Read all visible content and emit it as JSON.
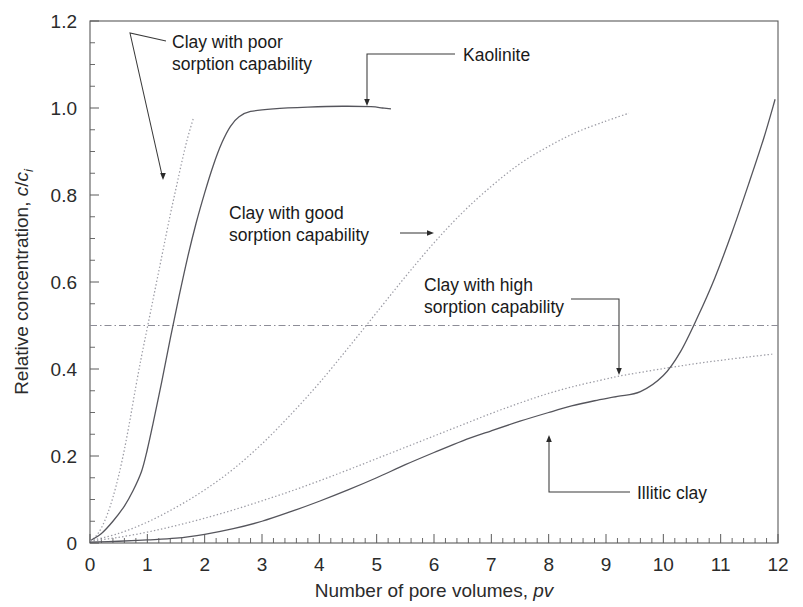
{
  "chart_data": {
    "type": "line",
    "title": "",
    "xlabel": "Number of pore volumes, pv",
    "xlabel_plain": "Number of pore volumes,",
    "xlabel_italic": "pv",
    "ylabel": "Relative concentration, c/ci",
    "ylabel_plain": "Relative concentration, ",
    "ylabel_italic_c": "c",
    "ylabel_slash": "/",
    "ylabel_italic_c2": "c",
    "ylabel_sub": "i",
    "xlim": [
      0,
      12
    ],
    "ylim": [
      0,
      1.2
    ],
    "xticks": [
      "0",
      "1",
      "2",
      "3",
      "4",
      "5",
      "6",
      "7",
      "8",
      "9",
      "10",
      "11",
      "12"
    ],
    "xtick_values": [
      0,
      1,
      2,
      3,
      4,
      5,
      6,
      7,
      8,
      9,
      10,
      11,
      12
    ],
    "yticks": [
      "0",
      "0.2",
      "0.4",
      "0.6",
      "0.8",
      "1.0",
      "1.2"
    ],
    "ytick_values": [
      0,
      0.2,
      0.4,
      0.6,
      0.8,
      1.0,
      1.2
    ],
    "x_minor_step": 0.2,
    "y_minor_step": 0.05,
    "grid": false,
    "legend_position": "inline-annotations",
    "reference_lines": [
      {
        "name": "half-breakthrough",
        "axis": "y",
        "value": 0.5,
        "style": "dash-dot"
      }
    ],
    "series": [
      {
        "name": "Clay with poor sorption capability",
        "style": "dotted",
        "color": "#9b9ba4",
        "points": [
          [
            0.0,
            0.005
          ],
          [
            0.1,
            0.015
          ],
          [
            0.2,
            0.035
          ],
          [
            0.3,
            0.065
          ],
          [
            0.4,
            0.105
          ],
          [
            0.5,
            0.155
          ],
          [
            0.6,
            0.215
          ],
          [
            0.7,
            0.285
          ],
          [
            0.8,
            0.36
          ],
          [
            0.9,
            0.43
          ],
          [
            1.0,
            0.495
          ],
          [
            1.1,
            0.56
          ],
          [
            1.2,
            0.625
          ],
          [
            1.3,
            0.69
          ],
          [
            1.4,
            0.755
          ],
          [
            1.5,
            0.815
          ],
          [
            1.6,
            0.875
          ],
          [
            1.7,
            0.93
          ],
          [
            1.8,
            0.975
          ]
        ]
      },
      {
        "name": "Kaolinite",
        "style": "solid",
        "color": "#55555c",
        "points": [
          [
            0.0,
            0.005
          ],
          [
            0.2,
            0.022
          ],
          [
            0.4,
            0.05
          ],
          [
            0.6,
            0.085
          ],
          [
            0.75,
            0.12
          ],
          [
            0.9,
            0.165
          ],
          [
            1.0,
            0.215
          ],
          [
            1.1,
            0.275
          ],
          [
            1.25,
            0.37
          ],
          [
            1.4,
            0.47
          ],
          [
            1.55,
            0.565
          ],
          [
            1.7,
            0.655
          ],
          [
            1.85,
            0.735
          ],
          [
            2.0,
            0.805
          ],
          [
            2.15,
            0.868
          ],
          [
            2.3,
            0.92
          ],
          [
            2.45,
            0.958
          ],
          [
            2.6,
            0.98
          ],
          [
            2.8,
            0.992
          ],
          [
            3.2,
            0.998
          ],
          [
            3.8,
            1.002
          ],
          [
            4.4,
            1.004
          ],
          [
            4.9,
            1.003
          ],
          [
            5.1,
            1.0
          ],
          [
            5.25,
            0.998
          ]
        ]
      },
      {
        "name": "Clay with good sorption capability",
        "style": "dotted",
        "color": "#9b9ba4",
        "points": [
          [
            0.0,
            0.005
          ],
          [
            0.5,
            0.022
          ],
          [
            1.0,
            0.048
          ],
          [
            1.5,
            0.082
          ],
          [
            2.0,
            0.122
          ],
          [
            2.5,
            0.17
          ],
          [
            3.0,
            0.228
          ],
          [
            3.5,
            0.295
          ],
          [
            4.0,
            0.368
          ],
          [
            4.5,
            0.448
          ],
          [
            5.0,
            0.53
          ],
          [
            5.5,
            0.612
          ],
          [
            6.0,
            0.69
          ],
          [
            6.5,
            0.76
          ],
          [
            7.0,
            0.82
          ],
          [
            7.5,
            0.872
          ],
          [
            8.0,
            0.912
          ],
          [
            8.5,
            0.945
          ],
          [
            9.0,
            0.97
          ],
          [
            9.4,
            0.988
          ]
        ]
      },
      {
        "name": "Clay with high sorption capability",
        "style": "dotted",
        "color": "#9b9ba4",
        "points": [
          [
            0.0,
            0.004
          ],
          [
            0.5,
            0.013
          ],
          [
            1.0,
            0.025
          ],
          [
            1.5,
            0.04
          ],
          [
            2.0,
            0.057
          ],
          [
            2.5,
            0.076
          ],
          [
            3.0,
            0.097
          ],
          [
            3.5,
            0.119
          ],
          [
            4.0,
            0.143
          ],
          [
            4.5,
            0.168
          ],
          [
            5.0,
            0.194
          ],
          [
            5.5,
            0.22
          ],
          [
            6.0,
            0.246
          ],
          [
            6.5,
            0.272
          ],
          [
            7.0,
            0.298
          ],
          [
            7.5,
            0.322
          ],
          [
            8.0,
            0.344
          ],
          [
            8.5,
            0.362
          ],
          [
            9.0,
            0.377
          ],
          [
            9.2,
            0.383
          ],
          [
            9.5,
            0.39
          ],
          [
            10.0,
            0.401
          ],
          [
            10.5,
            0.411
          ],
          [
            11.0,
            0.42
          ],
          [
            11.5,
            0.428
          ],
          [
            11.9,
            0.434
          ]
        ]
      },
      {
        "name": "Illitic clay",
        "style": "solid",
        "color": "#55555c",
        "points": [
          [
            0.0,
            0.002
          ],
          [
            0.5,
            0.004
          ],
          [
            1.0,
            0.007
          ],
          [
            1.5,
            0.011
          ],
          [
            2.0,
            0.02
          ],
          [
            2.5,
            0.033
          ],
          [
            3.0,
            0.05
          ],
          [
            3.5,
            0.072
          ],
          [
            4.0,
            0.096
          ],
          [
            4.5,
            0.122
          ],
          [
            5.0,
            0.15
          ],
          [
            5.5,
            0.18
          ],
          [
            6.0,
            0.208
          ],
          [
            6.5,
            0.235
          ],
          [
            7.0,
            0.258
          ],
          [
            7.5,
            0.28
          ],
          [
            8.0,
            0.3
          ],
          [
            8.4,
            0.315
          ],
          [
            8.8,
            0.327
          ],
          [
            9.2,
            0.337
          ],
          [
            9.6,
            0.348
          ],
          [
            10.0,
            0.385
          ],
          [
            10.3,
            0.44
          ],
          [
            10.6,
            0.52
          ],
          [
            10.9,
            0.61
          ],
          [
            11.2,
            0.715
          ],
          [
            11.5,
            0.83
          ],
          [
            11.75,
            0.93
          ],
          [
            11.95,
            1.02
          ]
        ]
      }
    ],
    "annotations": [
      {
        "id": "poor-sorption",
        "line1": "Clay with poor",
        "line2": "sorption capability",
        "text_x": 172,
        "text_y": 48,
        "leader": "M 166 41 L 130 33 L 162 175",
        "arrow_x": 163,
        "arrow_y": 180,
        "arrow_dir": "down"
      },
      {
        "id": "kaolinite",
        "line1": "Kaolinite",
        "line2": "",
        "text_x": 463,
        "text_y": 61,
        "leader": "M 455 54 L 367 54 L 367 100",
        "arrow_x": 367,
        "arrow_y": 106,
        "arrow_dir": "down"
      },
      {
        "id": "good-sorption",
        "line1": "Clay with good",
        "line2": "sorption capability",
        "text_x": 229,
        "text_y": 219,
        "leader": "M 400 233 L 428 233",
        "arrow_x": 434,
        "arrow_y": 233,
        "arrow_dir": "right"
      },
      {
        "id": "high-sorption",
        "line1": "Clay with high",
        "line2": "sorption capability",
        "text_x": 424,
        "text_y": 291,
        "leader": "M 571 299 L 619 299 L 619 369",
        "arrow_x": 619,
        "arrow_y": 375,
        "arrow_dir": "down"
      },
      {
        "id": "illitic-clay",
        "line1": "Illitic clay",
        "line2": "",
        "text_x": 637,
        "text_y": 499,
        "leader": "M 630 492 L 549 492 L 549 441",
        "arrow_x": 549,
        "arrow_y": 435,
        "arrow_dir": "up"
      }
    ]
  },
  "plot_geometry": {
    "left": 90,
    "right": 778,
    "top": 21,
    "bottom": 543
  }
}
